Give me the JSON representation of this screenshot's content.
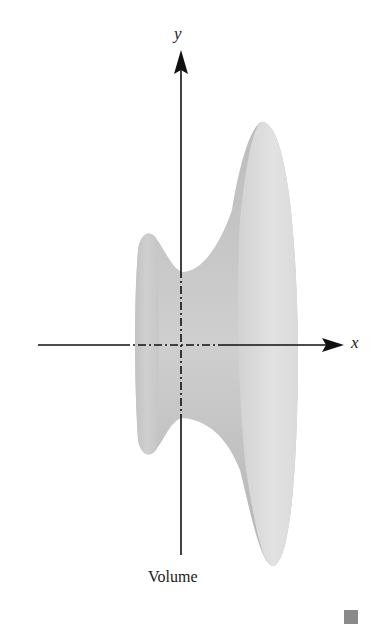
{
  "figure": {
    "caption": "Volume",
    "axes": {
      "x_label": "x",
      "y_label": "y"
    },
    "solid": {
      "description": "solid of revolution about the x-axis",
      "fill_color": "#d6d6d6",
      "shadow_color": "#b8b8b8",
      "highlight_color": "#ececec"
    },
    "axis_color": "#111111",
    "end_mark_color": "#8a8a8a"
  }
}
